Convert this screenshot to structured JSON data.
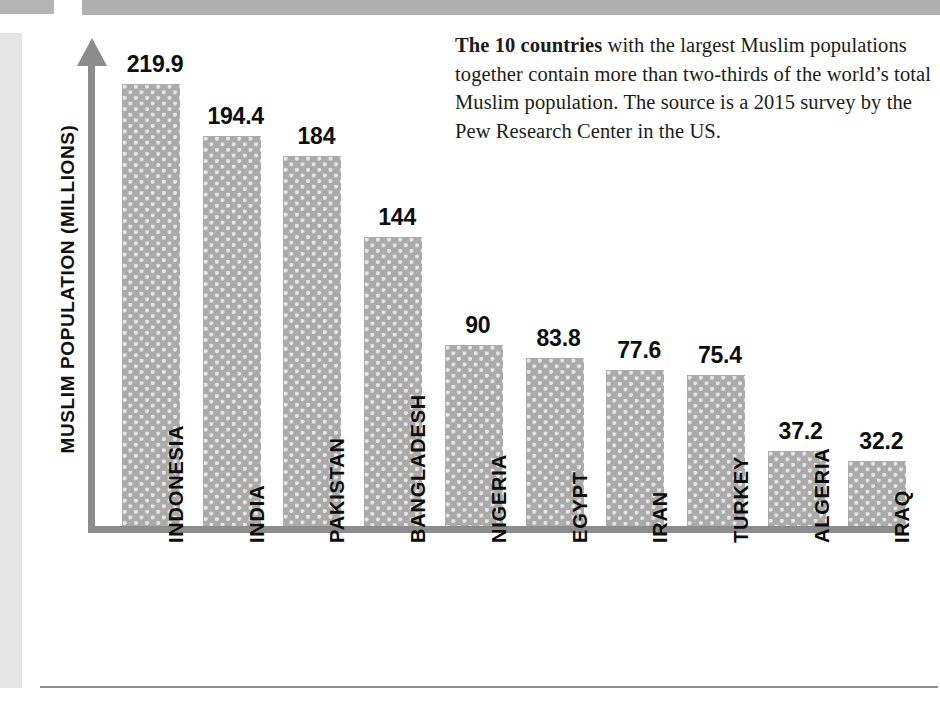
{
  "caption": {
    "lead": "The 10 countries",
    "rest": " with the largest Muslim populations together contain more than two-thirds of the world’s total Muslim population. The source is a 2015 survey by the Pew Research Center in the US."
  },
  "chart_data": {
    "type": "bar",
    "title": "",
    "xlabel": "",
    "ylabel": "MUSLIM POPULATION (MILLIONS)",
    "categories": [
      "INDONESIA",
      "INDIA",
      "PAKISTAN",
      "BANGLADESH",
      "NIGERIA",
      "EGYPT",
      "IRAN",
      "TURKEY",
      "ALGERIA",
      "IRAQ"
    ],
    "values": [
      219.9,
      194.4,
      184,
      144,
      90,
      83.8,
      77.6,
      75.4,
      37.2,
      32.2
    ],
    "value_labels": [
      "219.9",
      "194.4",
      "184",
      "144",
      "90",
      "83.8",
      "77.6",
      "75.4",
      "37.2",
      "32.2"
    ],
    "ylim": [
      0,
      232
    ],
    "grid": false,
    "legend": false,
    "bar_color": "#aaaaaa",
    "axis_color": "#8c8c8c",
    "text_color": "#0d0d0d"
  }
}
